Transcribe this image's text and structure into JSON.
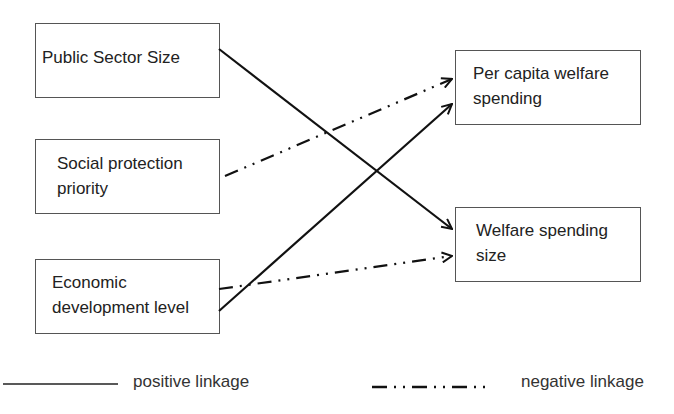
{
  "diagram": {
    "type": "causal-linkage-diagram",
    "nodes": [
      {
        "id": "public_sector_size",
        "label": "Public Sector Size",
        "column": "left"
      },
      {
        "id": "social_protection_priority",
        "label": "Social protection\npriority",
        "column": "left"
      },
      {
        "id": "economic_development_level",
        "label": "Economic\ndevelopment level",
        "column": "left"
      },
      {
        "id": "per_capita_welfare_spending",
        "label": "Per capita welfare\nspending",
        "column": "right"
      },
      {
        "id": "welfare_spending_size",
        "label": "Welfare spending\nsize",
        "column": "right"
      }
    ],
    "edges": [
      {
        "from": "public_sector_size",
        "to": "welfare_spending_size",
        "linkage": "positive"
      },
      {
        "from": "social_protection_priority",
        "to": "per_capita_welfare_spending",
        "linkage": "negative"
      },
      {
        "from": "economic_development_level",
        "to": "per_capita_welfare_spending",
        "linkage": "positive"
      },
      {
        "from": "economic_development_level",
        "to": "welfare_spending_size",
        "linkage": "negative"
      }
    ]
  },
  "legend": {
    "positive": {
      "label": "positive linkage",
      "style": "solid"
    },
    "negative": {
      "label": "negative linkage",
      "style": "dash-dot-dot"
    }
  },
  "colors": {
    "line": "#111111",
    "box_border": "#555555",
    "text": "#222222",
    "background": "#ffffff"
  }
}
